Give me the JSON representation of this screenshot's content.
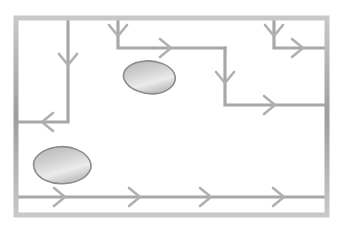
{
  "figure": {
    "canvas": {
      "width": 346,
      "height": 232
    },
    "colors": {
      "background": "#ffffff",
      "frame_stroke": "#a0a0a0",
      "frame_highlight": "#c9c9c9",
      "channel_stroke": "#a8a8a8",
      "arrow_stroke": "#b0b0b0",
      "blob_stroke": "#8a8a8a",
      "blob_fill_light": "#ededed",
      "blob_fill_dark": "#b8b8b8"
    },
    "stroke_widths": {
      "frame": 5,
      "channel": 3.2,
      "arrow": 2.6
    }
  },
  "frame": {
    "label": "outer-channel-frame",
    "x": 16,
    "y": 18,
    "width": 311,
    "height": 197
  },
  "channels": [
    {
      "name": "left-descending-channel",
      "points": "68,20 68,122 18,122",
      "direction": "down-then-left"
    },
    {
      "name": "upper-middle-channel",
      "points": "118,20 118,48 225,48",
      "direction": "down-then-right"
    },
    {
      "name": "middle-descending-channel",
      "points": "225,48 225,105 325,105",
      "direction": "down-then-right"
    },
    {
      "name": "top-right-channel",
      "points": "274,20 274,48 325,48",
      "direction": "down-then-right"
    },
    {
      "name": "bottom-main-channel",
      "points": "18,197 325,197",
      "direction": "right"
    }
  ],
  "arrows": [
    {
      "name": "arrow-left-channel-down",
      "x": 68,
      "y": 62,
      "rotation": 90
    },
    {
      "name": "arrow-left-channel-left",
      "x": 45,
      "y": 122,
      "rotation": 180
    },
    {
      "name": "arrow-upper-middle-down",
      "x": 118,
      "y": 33,
      "rotation": 90
    },
    {
      "name": "arrow-upper-middle-right",
      "x": 168,
      "y": 48,
      "rotation": 0
    },
    {
      "name": "arrow-middle-descend-down",
      "x": 225,
      "y": 80,
      "rotation": 90
    },
    {
      "name": "arrow-middle-descend-right",
      "x": 272,
      "y": 105,
      "rotation": 0
    },
    {
      "name": "arrow-top-right-down",
      "x": 274,
      "y": 33,
      "rotation": 90
    },
    {
      "name": "arrow-top-right-right",
      "x": 300,
      "y": 48,
      "rotation": 0
    },
    {
      "name": "arrow-bottom-1",
      "x": 62,
      "y": 197,
      "rotation": 0
    },
    {
      "name": "arrow-bottom-2",
      "x": 137,
      "y": 197,
      "rotation": 0
    },
    {
      "name": "arrow-bottom-3",
      "x": 208,
      "y": 197,
      "rotation": 0
    },
    {
      "name": "arrow-bottom-4",
      "x": 281,
      "y": 197,
      "rotation": 0
    }
  ],
  "obstacles": [
    {
      "name": "upper-obstacle",
      "path": "M 124,79 C 121,69 132,62 145,61 C 157,60 170,65 174,73 C 178,81 172,90 160,93 C 146,96 128,90 124,79 Z",
      "center_x": 148,
      "center_y": 77
    },
    {
      "name": "lower-obstacle",
      "path": "M 34,168 C 31,158 42,149 57,147 C 72,145 86,152 90,161 C 94,170 86,180 70,183 C 52,186 37,179 34,168 Z",
      "center_x": 62,
      "center_y": 165
    }
  ]
}
